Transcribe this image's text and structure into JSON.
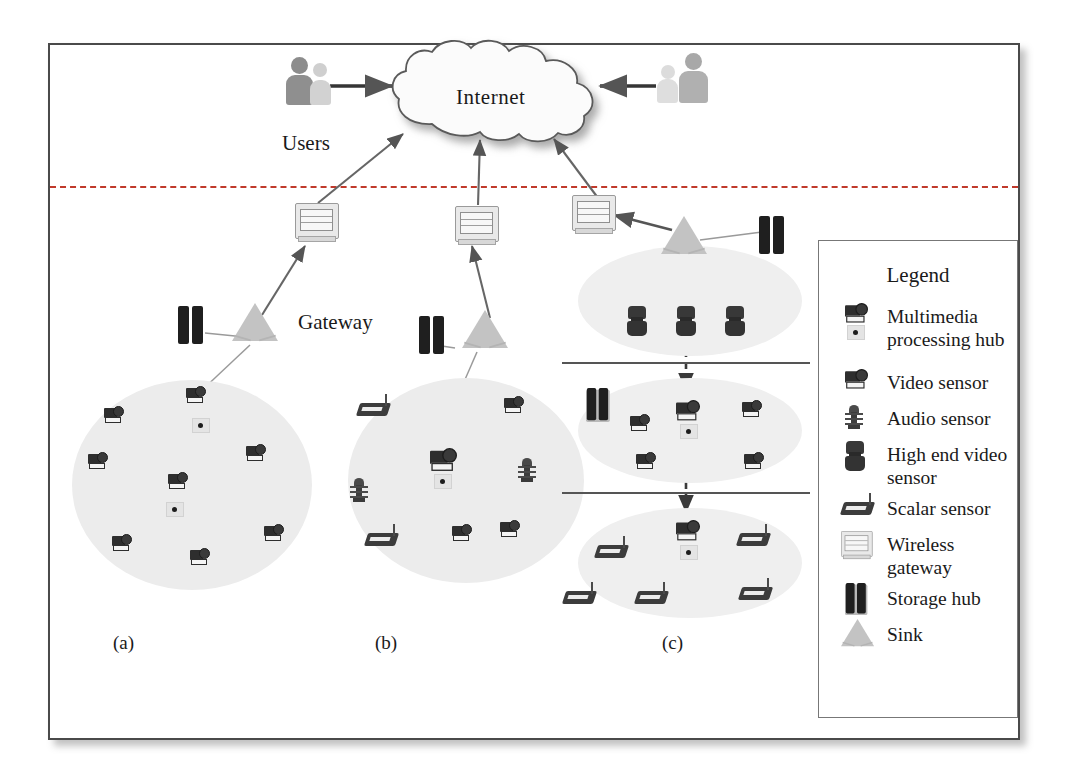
{
  "figure": {
    "internet_label": "Internet",
    "users_label": "Users",
    "gateway_label": "Gateway"
  },
  "subcaptions": [
    {
      "id": "a",
      "label": "(a)",
      "topology": "mesh / multi-hop video sensor cluster"
    },
    {
      "id": "b",
      "label": "(b)",
      "topology": "single-tier star cluster with heterogeneous sensors"
    },
    {
      "id": "c",
      "label": "(c)",
      "topology": "multi-tier hierarchical cluster"
    }
  ],
  "legend": {
    "title": "Legend",
    "items": [
      {
        "icon": "multimedia-processing-hub-icon",
        "label": "Multimedia processing hub"
      },
      {
        "icon": "video-sensor-icon",
        "label": "Video sensor"
      },
      {
        "icon": "audio-sensor-icon",
        "label": "Audio sensor"
      },
      {
        "icon": "high-end-video-sensor-icon",
        "label": "High end video sensor"
      },
      {
        "icon": "scalar-sensor-icon",
        "label": "Scalar sensor"
      },
      {
        "icon": "wireless-gateway-icon",
        "label": "Wireless gateway"
      },
      {
        "icon": "storage-hub-icon",
        "label": "Storage hub"
      },
      {
        "icon": "sink-icon",
        "label": "Sink"
      }
    ]
  },
  "colors": {
    "frame": "#4a4a4a",
    "tier_divider": "#c0392b",
    "cluster_fill": "#ececec",
    "device_dark": "#2e2e2e",
    "sink_grey": "#c3c3c3",
    "link": "#9a9a9a",
    "arrow": "#555555",
    "legend_border": "#777777",
    "text": "#1a1a1a"
  },
  "nodes": {
    "cluster_a": {
      "sink": 1,
      "storage_hub": 1,
      "video_sensors": 8,
      "multimedia_processing_hubs": 2
    },
    "cluster_b": {
      "sink": 1,
      "storage_hub": 1,
      "multimedia_processing_hub": 1,
      "video_sensors": 3,
      "audio_sensors": 2,
      "scalar_sensors": 2
    },
    "cluster_c": {
      "tier1": {
        "sink": 1,
        "storage_hub": 1,
        "high_end_video_sensors": 3
      },
      "tier2": {
        "storage_hub": 1,
        "multimedia_processing_hub": 1,
        "video_sensors": 4
      },
      "tier3": {
        "multimedia_processing_hub": 1,
        "scalar_sensors": 5
      }
    }
  },
  "gateways": {
    "count": 3,
    "label": "Wireless gateway"
  },
  "user_groups": [
    {
      "position": "left",
      "label": "Users"
    },
    {
      "position": "right",
      "label": ""
    }
  ]
}
